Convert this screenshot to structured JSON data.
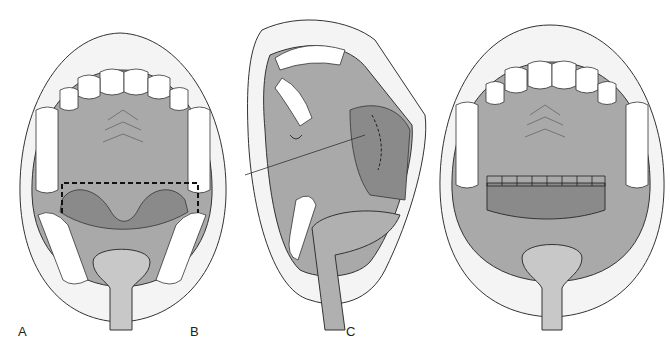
{
  "figure": {
    "panels": [
      {
        "label": "A",
        "description": "Open mouth, palate with dashed incision outline over soft palate"
      },
      {
        "label": "B",
        "description": "Oblique view, suture/needle at soft palate with dashed line"
      },
      {
        "label": "C",
        "description": "Open mouth, sutured flap border across soft palate"
      }
    ]
  },
  "colors": {
    "palate": "#a9a9a9",
    "dark_tissue": "#8a8a8a",
    "teeth": "#ffffff",
    "lips": "#f2f2f2",
    "outline": "#333333"
  }
}
